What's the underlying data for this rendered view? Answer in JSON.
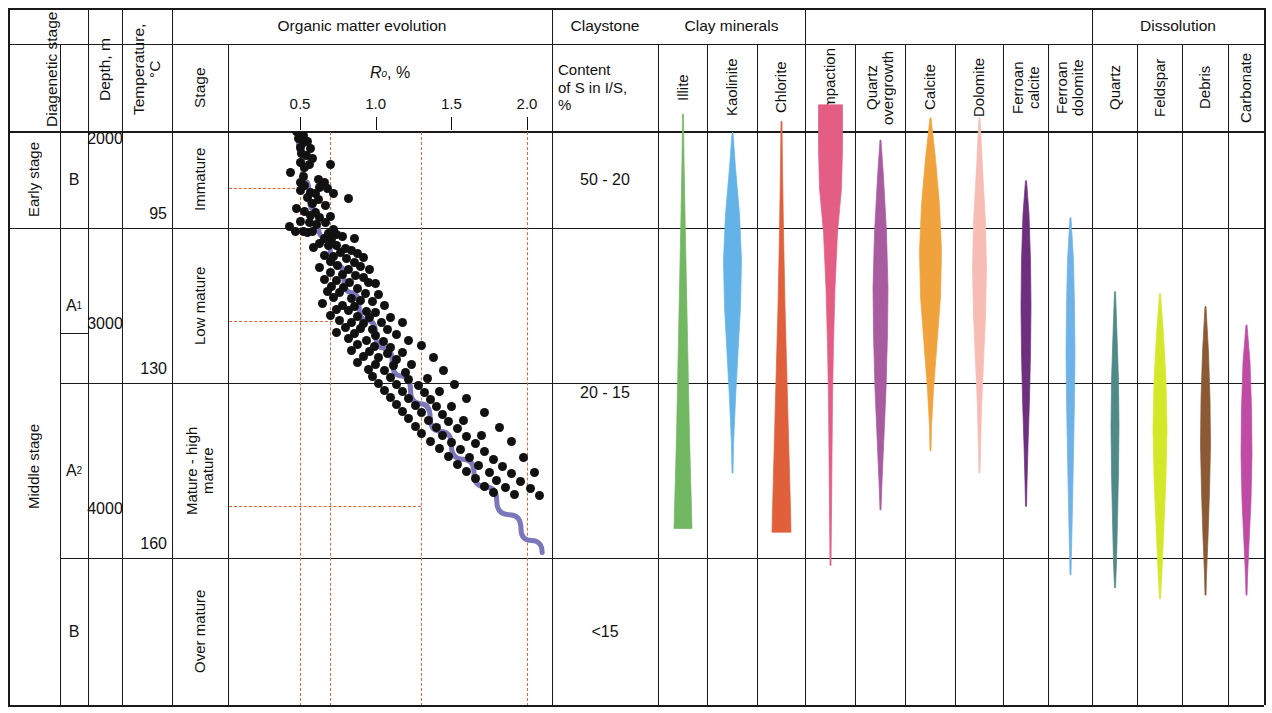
{
  "columns": {
    "diagenetic_stage": "Diagenetic stage",
    "substage": "",
    "depth": "Depth, m",
    "temperature": "Temperature, °C",
    "organic_matter_evolution": "Organic matter evolution",
    "stage": "Stage",
    "ro_axis": "Ro, %",
    "claystone": "Claystone",
    "claystone_sub": "Content of S in I/S, %",
    "clay_minerals": "Clay minerals",
    "dissolution": "Dissolution"
  },
  "stages": [
    {
      "label": "Early stage",
      "sub": "B"
    },
    {
      "label": "Middle stage",
      "sub_a1": "A",
      "sub_a1_idx": "1",
      "sub_a2": "A",
      "sub_a2_idx": "2",
      "sub_b": "B"
    }
  ],
  "stage_labels": {
    "early": "Early stage",
    "middle": "Middle stage",
    "b_top": "B",
    "a1": "A",
    "a1_sub": "1",
    "a2": "A",
    "a2_sub": "2",
    "b_bottom": "B"
  },
  "depth_labels": [
    "2000",
    "3000",
    "4000"
  ],
  "temperature_labels": [
    "95",
    "130",
    "160"
  ],
  "maturity_stages": [
    "Immature",
    "Low mature",
    "Mature - high mature",
    "Over mature"
  ],
  "claystone_values": [
    "50 - 20",
    "20 - 15",
    "<15"
  ],
  "clay_mineral_names": [
    "Illite",
    "Kaolinite",
    "Chlorite"
  ],
  "diagenetic_mineral_names": [
    "Compaction",
    "Quartz overgrowth",
    "Calcite",
    "Dolomite",
    "Ferroan calcite",
    "Ferroan dolomite"
  ],
  "dissolution_names": [
    "Quartz",
    "Feldspar",
    "Debris",
    "Carbonate"
  ],
  "chart_data": {
    "type": "scatter",
    "title": "Organic matter evolution",
    "xlabel": "Ro, %",
    "ylabel": "Depth, m",
    "xlim": [
      0.22,
      2.18
    ],
    "ylim": [
      1800,
      4900
    ],
    "xticks": [
      0.5,
      1.0,
      1.5,
      2.0
    ],
    "xtick_labels": [
      "0.5",
      "1.0",
      "1.5",
      "2.0"
    ],
    "grid": false,
    "reference_lines_x": [
      0.5,
      0.7,
      1.3,
      2.0
    ],
    "reference_lines_y_depth": [
      2260,
      2980,
      3980
    ],
    "trend_curve_name": "Ro vs depth trend",
    "trend_curve_color": "#7b77bb",
    "points_color": "#111111",
    "points": [
      [
        0.47,
        1862
      ],
      [
        0.49,
        1905
      ],
      [
        0.48,
        1955
      ],
      [
        0.52,
        1975
      ],
      [
        0.49,
        1990
      ],
      [
        0.52,
        2012
      ],
      [
        0.55,
        2010
      ],
      [
        0.5,
        2040
      ],
      [
        0.57,
        2045
      ],
      [
        0.51,
        2075
      ],
      [
        0.54,
        2082
      ],
      [
        0.58,
        2098
      ],
      [
        0.5,
        2120
      ],
      [
        0.56,
        2130
      ],
      [
        0.53,
        2150
      ],
      [
        0.7,
        2132
      ],
      [
        0.44,
        2175
      ],
      [
        0.52,
        2195
      ],
      [
        0.62,
        2215
      ],
      [
        0.5,
        2230
      ],
      [
        0.66,
        2232
      ],
      [
        0.53,
        2248
      ],
      [
        0.63,
        2255
      ],
      [
        0.68,
        2262
      ],
      [
        0.5,
        2272
      ],
      [
        0.57,
        2282
      ],
      [
        0.6,
        2290
      ],
      [
        0.72,
        2288
      ],
      [
        0.55,
        2310
      ],
      [
        0.62,
        2322
      ],
      [
        0.58,
        2342
      ],
      [
        0.67,
        2352
      ],
      [
        0.82,
        2318
      ],
      [
        0.48,
        2372
      ],
      [
        0.53,
        2388
      ],
      [
        0.6,
        2392
      ],
      [
        0.57,
        2410
      ],
      [
        0.63,
        2420
      ],
      [
        0.7,
        2412
      ],
      [
        0.5,
        2438
      ],
      [
        0.56,
        2448
      ],
      [
        0.61,
        2455
      ],
      [
        0.67,
        2448
      ],
      [
        0.43,
        2470
      ],
      [
        0.47,
        2492
      ],
      [
        0.52,
        2492
      ],
      [
        0.55,
        2498
      ],
      [
        0.58,
        2495
      ],
      [
        0.72,
        2485
      ],
      [
        0.69,
        2505
      ],
      [
        0.74,
        2512
      ],
      [
        0.78,
        2520
      ],
      [
        0.66,
        2530
      ],
      [
        0.71,
        2540
      ],
      [
        0.86,
        2532
      ],
      [
        0.63,
        2560
      ],
      [
        0.69,
        2568
      ],
      [
        0.74,
        2572
      ],
      [
        0.59,
        2582
      ],
      [
        0.8,
        2588
      ],
      [
        0.84,
        2595
      ],
      [
        0.77,
        2608
      ],
      [
        0.88,
        2612
      ],
      [
        0.66,
        2625
      ],
      [
        0.72,
        2632
      ],
      [
        0.81,
        2640
      ],
      [
        0.92,
        2635
      ],
      [
        0.7,
        2655
      ],
      [
        0.86,
        2662
      ],
      [
        0.75,
        2678
      ],
      [
        0.63,
        2688
      ],
      [
        0.9,
        2685
      ],
      [
        0.82,
        2700
      ],
      [
        0.96,
        2702
      ],
      [
        0.7,
        2718
      ],
      [
        0.78,
        2725
      ],
      [
        0.87,
        2730
      ],
      [
        0.92,
        2742
      ],
      [
        0.66,
        2755
      ],
      [
        0.74,
        2762
      ],
      [
        0.83,
        2768
      ],
      [
        0.95,
        2770
      ],
      [
        1.0,
        2778
      ],
      [
        0.71,
        2792
      ],
      [
        0.79,
        2798
      ],
      [
        0.88,
        2805
      ],
      [
        0.68,
        2818
      ],
      [
        0.76,
        2825
      ],
      [
        0.93,
        2828
      ],
      [
        1.02,
        2835
      ],
      [
        0.72,
        2852
      ],
      [
        0.84,
        2858
      ],
      [
        0.9,
        2865
      ],
      [
        0.98,
        2872
      ],
      [
        0.65,
        2885
      ],
      [
        0.78,
        2892
      ],
      [
        0.86,
        2898
      ],
      [
        1.06,
        2895
      ],
      [
        0.74,
        2915
      ],
      [
        0.82,
        2922
      ],
      [
        0.94,
        2928
      ],
      [
        1.0,
        2935
      ],
      [
        0.7,
        2948
      ],
      [
        0.88,
        2955
      ],
      [
        0.96,
        2962
      ],
      [
        1.1,
        2958
      ],
      [
        0.76,
        2978
      ],
      [
        0.84,
        2985
      ],
      [
        0.92,
        2992
      ],
      [
        1.04,
        2988
      ],
      [
        1.18,
        2985
      ],
      [
        0.8,
        3012
      ],
      [
        0.9,
        3018
      ],
      [
        0.98,
        3025
      ],
      [
        1.08,
        3022
      ],
      [
        0.74,
        3042
      ],
      [
        0.86,
        3048
      ],
      [
        1.0,
        3055
      ],
      [
        1.14,
        3052
      ],
      [
        0.82,
        3075
      ],
      [
        0.94,
        3082
      ],
      [
        1.05,
        3088
      ],
      [
        1.22,
        3085
      ],
      [
        0.88,
        3108
      ],
      [
        0.99,
        3115
      ],
      [
        1.1,
        3120
      ],
      [
        1.3,
        3112
      ],
      [
        0.84,
        3138
      ],
      [
        0.96,
        3145
      ],
      [
        1.08,
        3152
      ],
      [
        1.18,
        3148
      ],
      [
        0.92,
        3172
      ],
      [
        1.02,
        3178
      ],
      [
        1.14,
        3185
      ],
      [
        1.38,
        3178
      ],
      [
        0.88,
        3205
      ],
      [
        1.0,
        3212
      ],
      [
        1.12,
        3218
      ],
      [
        1.24,
        3215
      ],
      [
        0.95,
        3242
      ],
      [
        1.06,
        3248
      ],
      [
        1.2,
        3255
      ],
      [
        1.45,
        3248
      ],
      [
        0.98,
        3278
      ],
      [
        1.1,
        3285
      ],
      [
        1.22,
        3292
      ],
      [
        1.34,
        3288
      ],
      [
        1.02,
        3315
      ],
      [
        1.14,
        3322
      ],
      [
        1.28,
        3328
      ],
      [
        1.52,
        3320
      ],
      [
        1.06,
        3352
      ],
      [
        1.18,
        3358
      ],
      [
        1.32,
        3365
      ],
      [
        1.42,
        3362
      ],
      [
        1.1,
        3392
      ],
      [
        1.22,
        3398
      ],
      [
        1.36,
        3405
      ],
      [
        1.6,
        3398
      ],
      [
        1.14,
        3428
      ],
      [
        1.26,
        3435
      ],
      [
        1.4,
        3442
      ],
      [
        1.5,
        3438
      ],
      [
        1.18,
        3468
      ],
      [
        1.3,
        3475
      ],
      [
        1.44,
        3482
      ],
      [
        1.72,
        3475
      ],
      [
        1.22,
        3508
      ],
      [
        1.35,
        3515
      ],
      [
        1.48,
        3522
      ],
      [
        1.58,
        3518
      ],
      [
        1.26,
        3548
      ],
      [
        1.4,
        3555
      ],
      [
        1.54,
        3562
      ],
      [
        1.82,
        3552
      ],
      [
        1.3,
        3588
      ],
      [
        1.44,
        3595
      ],
      [
        1.6,
        3602
      ],
      [
        1.7,
        3598
      ],
      [
        1.36,
        3628
      ],
      [
        1.5,
        3635
      ],
      [
        1.66,
        3642
      ],
      [
        1.9,
        3632
      ],
      [
        1.42,
        3668
      ],
      [
        1.56,
        3675
      ],
      [
        1.72,
        3682
      ],
      [
        1.48,
        3712
      ],
      [
        1.62,
        3718
      ],
      [
        1.78,
        3725
      ],
      [
        1.98,
        3715
      ],
      [
        1.54,
        3752
      ],
      [
        1.68,
        3758
      ],
      [
        1.84,
        3765
      ],
      [
        1.6,
        3792
      ],
      [
        1.75,
        3798
      ],
      [
        1.9,
        3805
      ],
      [
        2.05,
        3798
      ],
      [
        1.66,
        3832
      ],
      [
        1.8,
        3838
      ],
      [
        1.96,
        3845
      ],
      [
        1.72,
        3872
      ],
      [
        1.86,
        3878
      ],
      [
        2.02,
        3885
      ],
      [
        1.78,
        3908
      ],
      [
        1.92,
        3915
      ],
      [
        2.08,
        3920
      ]
    ],
    "trend_path": [
      [
        0.47,
        1860
      ],
      [
        0.49,
        2000
      ],
      [
        0.52,
        2150
      ],
      [
        0.56,
        2300
      ],
      [
        0.62,
        2450
      ],
      [
        0.7,
        2600
      ],
      [
        0.79,
        2750
      ],
      [
        0.89,
        2900
      ],
      [
        1.0,
        3050
      ],
      [
        1.11,
        3200
      ],
      [
        1.23,
        3350
      ],
      [
        1.36,
        3500
      ],
      [
        1.5,
        3650
      ],
      [
        1.65,
        3800
      ],
      [
        1.8,
        3950
      ],
      [
        1.96,
        4100
      ],
      [
        2.1,
        4230
      ]
    ]
  },
  "bars": [
    {
      "name": "Illite",
      "color": "#72b762",
      "group": "clay",
      "profile": [
        [
          1860,
          1
        ],
        [
          2100,
          2
        ],
        [
          2400,
          4
        ],
        [
          2800,
          7
        ],
        [
          3200,
          10
        ],
        [
          3600,
          13
        ],
        [
          3900,
          16
        ],
        [
          4100,
          18
        ]
      ]
    },
    {
      "name": "Kaolinite",
      "color": "#63b3e8",
      "group": "clay",
      "profile": [
        [
          1960,
          1
        ],
        [
          2150,
          6
        ],
        [
          2400,
          14
        ],
        [
          2650,
          18
        ],
        [
          2900,
          16
        ],
        [
          3150,
          11
        ],
        [
          3400,
          6
        ],
        [
          3650,
          2
        ],
        [
          3800,
          1
        ]
      ]
    },
    {
      "name": "Chlorite",
      "color": "#e0603c",
      "group": "clay",
      "profile": [
        [
          1900,
          1
        ],
        [
          2150,
          2
        ],
        [
          2500,
          4
        ],
        [
          2900,
          7
        ],
        [
          3300,
          11
        ],
        [
          3700,
          15
        ],
        [
          4000,
          18
        ],
        [
          4120,
          19
        ]
      ]
    },
    {
      "name": "Compaction",
      "color": "#e35d84",
      "group": "diagenetic",
      "profile": [
        [
          1810,
          24
        ],
        [
          2050,
          24
        ],
        [
          2260,
          22
        ],
        [
          2500,
          14
        ],
        [
          2800,
          9
        ],
        [
          3100,
          6
        ],
        [
          3400,
          4
        ],
        [
          3700,
          3
        ],
        [
          4000,
          2
        ],
        [
          4300,
          1
        ]
      ]
    },
    {
      "name": "Quartz overgrowth",
      "color": "#a95ba0",
      "group": "diagenetic",
      "profile": [
        [
          2000,
          1
        ],
        [
          2200,
          6
        ],
        [
          2500,
          12
        ],
        [
          2800,
          15
        ],
        [
          3050,
          14
        ],
        [
          3350,
          11
        ],
        [
          3600,
          7
        ],
        [
          3850,
          3
        ],
        [
          4000,
          1
        ]
      ]
    },
    {
      "name": "Calcite",
      "color": "#f0a33c",
      "group": "diagenetic",
      "profile": [
        [
          1880,
          1
        ],
        [
          2100,
          10
        ],
        [
          2350,
          18
        ],
        [
          2600,
          22
        ],
        [
          2850,
          20
        ],
        [
          3100,
          13
        ],
        [
          3350,
          6
        ],
        [
          3550,
          2
        ],
        [
          3680,
          1
        ]
      ]
    },
    {
      "name": "Dolomite",
      "color": "#f7bcb4",
      "group": "diagenetic",
      "profile": [
        [
          1880,
          1
        ],
        [
          2150,
          6
        ],
        [
          2450,
          12
        ],
        [
          2700,
          14
        ],
        [
          2950,
          12
        ],
        [
          3200,
          8
        ],
        [
          3450,
          4
        ],
        [
          3680,
          2
        ],
        [
          3800,
          1
        ]
      ]
    },
    {
      "name": "Ferroan calcite",
      "color": "#6e2f7e",
      "group": "diagenetic",
      "profile": [
        [
          2220,
          1
        ],
        [
          2400,
          6
        ],
        [
          2650,
          9
        ],
        [
          2900,
          10
        ],
        [
          3150,
          9
        ],
        [
          3400,
          7
        ],
        [
          3650,
          4
        ],
        [
          3850,
          2
        ],
        [
          3980,
          1
        ]
      ]
    },
    {
      "name": "Ferroan dolomite",
      "color": "#6fb2e8",
      "group": "diagenetic",
      "profile": [
        [
          2420,
          1
        ],
        [
          2650,
          6
        ],
        [
          2900,
          8
        ],
        [
          3150,
          9
        ],
        [
          3400,
          8
        ],
        [
          3700,
          6
        ],
        [
          3980,
          4
        ],
        [
          4220,
          2
        ],
        [
          4350,
          1
        ]
      ]
    },
    {
      "name": "Quartz",
      "color": "#4f8a88",
      "group": "dissolution",
      "profile": [
        [
          2820,
          1
        ],
        [
          3050,
          4
        ],
        [
          3300,
          7
        ],
        [
          3550,
          8
        ],
        [
          3800,
          7
        ],
        [
          4050,
          5
        ],
        [
          4280,
          3
        ],
        [
          4420,
          1
        ]
      ]
    },
    {
      "name": "Feldspar",
      "color": "#d4e82a",
      "group": "dissolution",
      "profile": [
        [
          2830,
          1
        ],
        [
          3050,
          7
        ],
        [
          3300,
          12
        ],
        [
          3560,
          14
        ],
        [
          3820,
          12
        ],
        [
          4080,
          8
        ],
        [
          4330,
          4
        ],
        [
          4480,
          1
        ]
      ]
    },
    {
      "name": "Debris",
      "color": "#8b5a34",
      "group": "dissolution",
      "profile": [
        [
          2900,
          1
        ],
        [
          3150,
          6
        ],
        [
          3400,
          9
        ],
        [
          3650,
          10
        ],
        [
          3900,
          8
        ],
        [
          4150,
          5
        ],
        [
          4350,
          2
        ],
        [
          4460,
          1
        ]
      ]
    },
    {
      "name": "Carbonate",
      "color": "#c04ba4",
      "group": "dissolution",
      "profile": [
        [
          3000,
          1
        ],
        [
          3200,
          7
        ],
        [
          3450,
          10
        ],
        [
          3700,
          11
        ],
        [
          3950,
          9
        ],
        [
          4180,
          5
        ],
        [
          4360,
          2
        ],
        [
          4460,
          1
        ]
      ]
    }
  ]
}
